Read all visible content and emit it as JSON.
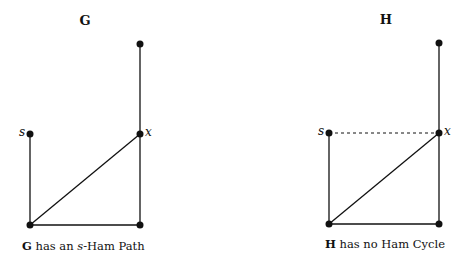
{
  "graphs": [
    {
      "name": "G",
      "caption_bold": "G",
      "caption_pre": " has an ",
      "caption_italic": "s",
      "caption_post": "-Ham Path",
      "nodes": {
        "top": [
          140,
          44
        ],
        "s": [
          30,
          134
        ],
        "x": [
          140,
          134
        ],
        "bottom_left": [
          30,
          225
        ],
        "bottom_right": [
          140,
          225
        ]
      },
      "edges": [
        [
          "top",
          "x",
          "solid"
        ],
        [
          "s",
          "bottom_left",
          "solid"
        ],
        [
          "bottom_left",
          "x",
          "solid"
        ],
        [
          "bottom_left",
          "bottom_right",
          "solid"
        ],
        [
          "bottom_right",
          "x",
          "solid"
        ]
      ],
      "labels": {
        "s": "s",
        "x": "x"
      }
    },
    {
      "name": "H",
      "caption_bold": "H",
      "caption_pre": " has no Ham Cycle",
      "caption_italic": "",
      "caption_post": "",
      "nodes": {
        "top": [
          439,
          43
        ],
        "s": [
          329,
          133
        ],
        "x": [
          439,
          133
        ],
        "bottom_left": [
          329,
          224
        ],
        "bottom_right": [
          439,
          224
        ]
      },
      "edges": [
        [
          "top",
          "x",
          "solid"
        ],
        [
          "s",
          "bottom_left",
          "solid"
        ],
        [
          "bottom_left",
          "x",
          "solid"
        ],
        [
          "bottom_left",
          "bottom_right",
          "solid"
        ],
        [
          "bottom_right",
          "x",
          "solid"
        ],
        [
          "s",
          "x",
          "dashed"
        ]
      ],
      "labels": {
        "s": "s",
        "x": "x"
      }
    }
  ]
}
